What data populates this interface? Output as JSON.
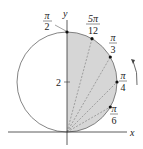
{
  "diagram": {
    "axes": {
      "x_label": "x",
      "y_label": "y"
    },
    "y_tick": "2",
    "angle_labels": [
      {
        "num": "π",
        "den": "2"
      },
      {
        "num": "5π",
        "den": "12"
      },
      {
        "num": "π",
        "den": "3"
      },
      {
        "num": "π",
        "den": "4"
      },
      {
        "num": "π",
        "den": "6"
      }
    ],
    "colors": {
      "shade": "#d6d6d6",
      "stroke": "#555555",
      "point": "#111111"
    }
  }
}
